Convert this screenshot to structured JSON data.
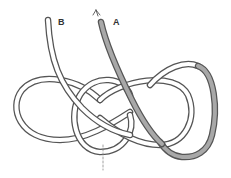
{
  "diagram": {
    "type": "knot-tying-illustration",
    "labels": {
      "a": "A",
      "b": "B"
    },
    "strands": [
      {
        "id": "A",
        "description": "working end, shaded",
        "fill": "#a8a8a8",
        "has_arrow": true
      },
      {
        "id": "B",
        "description": "standing part, white",
        "fill": "#ffffff",
        "has_arrow": false
      }
    ],
    "colors": {
      "rope_outline": "#555555",
      "rope_fill": "#ffffff",
      "shaded_fill": "#a8a8a8",
      "guide_line": "#888888",
      "background": "#ffffff"
    },
    "annotations": {
      "dashed_guide": "vertical dashed guideline below central crossing",
      "arrow": "arrow at top of strand A indicating pull direction"
    }
  }
}
